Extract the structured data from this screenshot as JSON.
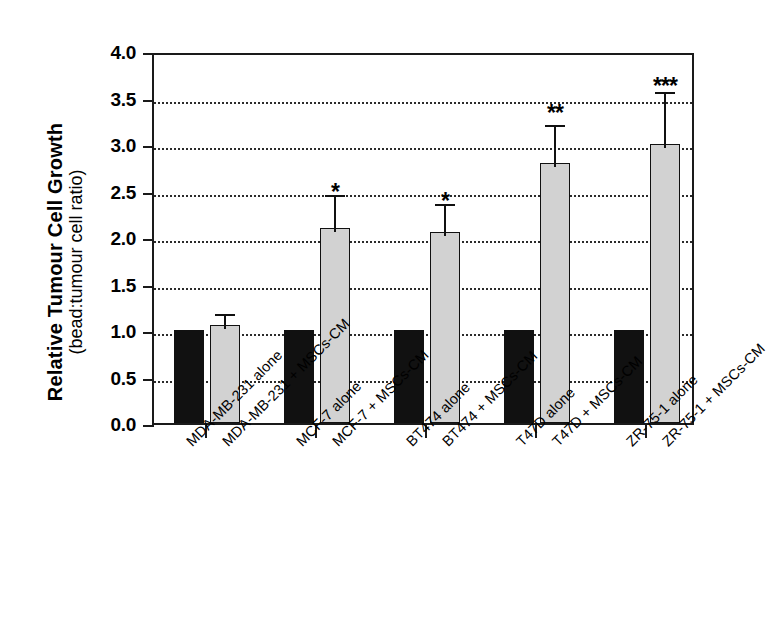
{
  "chart_data": {
    "type": "bar",
    "title": "",
    "subtitle": "",
    "ylabel": "Relative Tumour Cell Growth",
    "ylabel_sub": "(bead:tumour cell ratio)",
    "xlabel": "",
    "ylim": [
      0.0,
      4.0
    ],
    "ytick_values": [
      0.0,
      0.5,
      1.0,
      1.5,
      2.0,
      2.5,
      3.0,
      3.5,
      4.0
    ],
    "ytick_labels": [
      "0.0",
      "0.5",
      "1.0",
      "1.5",
      "2.0",
      "2.5",
      "3.0",
      "3.5",
      "4.0"
    ],
    "grid": "horizontal-dotted",
    "legend_position": "none",
    "categories": [
      "MDA-MB-231 alone",
      "MDA-MB-231 + MSCs-CM",
      "MCF-7 alone",
      "MCF-7 + MSCs-CM",
      "BT474 alone",
      "BT474 + MSCs-CM",
      "T47D alone",
      "T47D + MSCs-CM",
      "ZR-75-1 alone",
      "ZR-75-1 + MSCs-CM"
    ],
    "values": [
      1.0,
      1.05,
      1.0,
      2.1,
      1.0,
      2.05,
      1.0,
      2.8,
      1.0,
      3.0
    ],
    "errors": [
      0.0,
      0.17,
      0.0,
      0.4,
      0.0,
      0.35,
      0.0,
      0.45,
      0.0,
      0.6
    ],
    "bar_colors": [
      "#111111",
      "#d2d2d2",
      "#111111",
      "#d2d2d2",
      "#111111",
      "#d2d2d2",
      "#111111",
      "#d2d2d2",
      "#111111",
      "#d2d2d2"
    ],
    "annotations": [
      {
        "category_index": 3,
        "text": "*",
        "value": 2.65
      },
      {
        "category_index": 5,
        "text": "*",
        "value": 2.55
      },
      {
        "category_index": 7,
        "text": "**",
        "value": 3.5
      },
      {
        "category_index": 9,
        "text": "***",
        "value": 3.78
      }
    ],
    "colors": {
      "control_bar": "#111111",
      "treatment_bar": "#d2d2d2",
      "axis": "#1a1a1a",
      "gridline": "#2b2b2b",
      "text": "#000000"
    }
  }
}
